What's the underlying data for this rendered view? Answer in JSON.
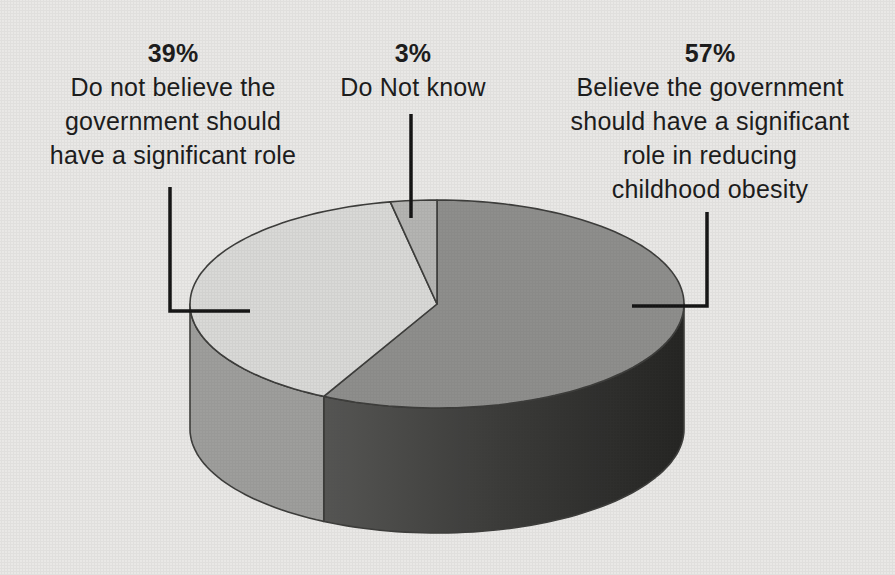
{
  "figure": {
    "background": "#e9e8e6",
    "outline_color": "#3c3c3a",
    "leader_color": "#141414",
    "text_color": "#1b1b1b"
  },
  "labels": {
    "left": {
      "pct": "39%",
      "lines": [
        "Do not believe the",
        "government should",
        "have a significant role"
      ]
    },
    "middle": {
      "pct": "3%",
      "lines": [
        "Do Not know"
      ]
    },
    "right": {
      "pct": "57%",
      "lines": [
        "Believe the government",
        "should have a significant",
        "role in reducing",
        "childhood obesity"
      ]
    }
  },
  "chart_data": {
    "type": "pie",
    "projection": "3d",
    "title": "",
    "units": "percent",
    "direction": "clockwise",
    "start_angle_deg": -90,
    "slices": [
      {
        "name": "believe-significant-role",
        "label": "Believe the government should have a significant role in reducing childhood obesity",
        "value": 57,
        "top_color": "#8e8e8c",
        "side_color": [
          "#555553",
          "#3a3a38",
          "#242422"
        ]
      },
      {
        "name": "do-not-believe",
        "label": "Do not believe the government should have a significant role",
        "value": 39,
        "top_color": "#d9d9d7",
        "side_color": "#9e9e9c"
      },
      {
        "name": "do-not-know",
        "label": "Do Not know",
        "value": 3,
        "top_color": "#b4b4b2"
      }
    ],
    "geometry": {
      "cx": 437,
      "cy": 304,
      "rx": 247,
      "ry": 104,
      "depth": 125
    },
    "leader_lines": [
      {
        "for": "do-not-believe",
        "points": [
          [
            170,
            187
          ],
          [
            170,
            311
          ],
          [
            250,
            311
          ]
        ]
      },
      {
        "for": "do-not-know",
        "points": [
          [
            411,
            114
          ],
          [
            411,
            218
          ]
        ]
      },
      {
        "for": "believe-significant-role",
        "points": [
          [
            707,
            212
          ],
          [
            707,
            306
          ],
          [
            632,
            306
          ]
        ]
      }
    ]
  }
}
